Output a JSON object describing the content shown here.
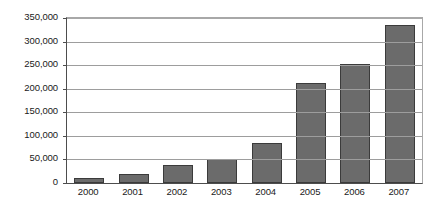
{
  "chart_data": {
    "type": "bar",
    "title": "",
    "subtitle": "",
    "xlabel": "",
    "ylabel": "",
    "categories": [
      "2000",
      "2001",
      "2002",
      "2003",
      "2004",
      "2005",
      "2006",
      "2007"
    ],
    "values": [
      11000,
      20000,
      38000,
      50000,
      85000,
      213000,
      253000,
      336000
    ],
    "series": [
      {
        "name": "",
        "values": [
          11000,
          20000,
          38000,
          50000,
          85000,
          213000,
          253000,
          336000
        ]
      }
    ],
    "ylim": [
      0,
      350000
    ],
    "ytick_values": [
      0,
      50000,
      100000,
      150000,
      200000,
      250000,
      300000,
      350000
    ],
    "ytick_labels": [
      "0",
      "50,000",
      "100,000",
      "150,000",
      "200,000",
      "250,000",
      "300,000",
      "350,000"
    ],
    "xtick_labels": [
      "2000",
      "2001",
      "2002",
      "2003",
      "2004",
      "2005",
      "2006",
      "2007"
    ],
    "grid": true,
    "grid_axis": "y",
    "legend": false,
    "legend_position": "none",
    "bar_color": "#6b6b6b",
    "bar_border_color": "#3b3b3b",
    "grid_color": "#9d9d9d",
    "axis_color": "#4d4d4d",
    "background_color": "#ffffff",
    "annotations": []
  }
}
